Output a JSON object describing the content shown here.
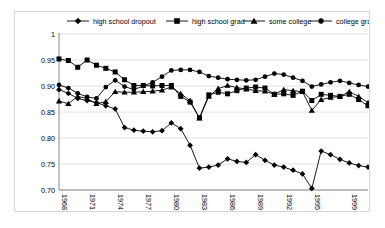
{
  "chart_data": {
    "type": "line",
    "title": "",
    "subtitle": "",
    "xlabel": "",
    "ylabel": "",
    "grid": true,
    "legend_position": "top",
    "ylim": [
      0.7,
      1.0
    ],
    "yticks": [
      "1",
      "0.95",
      "0.90",
      "0.85",
      "0.80",
      "0.75",
      "0.70"
    ],
    "ytick_values": [
      1.0,
      0.95,
      0.9,
      0.85,
      0.8,
      0.75,
      0.7
    ],
    "x": [
      1968,
      1969,
      1970,
      1971,
      1972,
      1973,
      1974,
      1975,
      1976,
      1977,
      1978,
      1979,
      1980,
      1981,
      1982,
      1983,
      1984,
      1985,
      1986,
      1987,
      1988,
      1989,
      1990,
      1991,
      1992,
      1993,
      1994,
      1995,
      1996,
      1997,
      1998,
      1999,
      2000,
      2001
    ],
    "xtick_labels": [
      "1968",
      "1971",
      "1974",
      "1977",
      "1980",
      "1983",
      "1986",
      "1989",
      "1992",
      "1995",
      "1999"
    ],
    "xtick_values": [
      1968,
      1971,
      1974,
      1977,
      1980,
      1983,
      1986,
      1989,
      1992,
      1995,
      1999
    ],
    "series": [
      {
        "name": "high school dropout",
        "marker": "diamond",
        "values": [
          0.893,
          0.886,
          0.876,
          0.872,
          0.868,
          0.862,
          0.856,
          0.82,
          0.815,
          0.813,
          0.812,
          0.814,
          0.829,
          0.818,
          0.786,
          0.742,
          0.744,
          0.748,
          0.76,
          0.755,
          0.753,
          0.768,
          0.757,
          0.748,
          0.744,
          0.738,
          0.731,
          0.703,
          0.775,
          0.768,
          0.759,
          0.752,
          0.747,
          0.744
        ]
      },
      {
        "name": "high school grad",
        "marker": "square",
        "values": [
          0.952,
          0.949,
          0.936,
          0.95,
          0.94,
          0.934,
          0.927,
          0.912,
          0.901,
          0.901,
          0.9,
          0.901,
          0.901,
          0.88,
          0.869,
          0.839,
          0.883,
          0.888,
          0.885,
          0.891,
          0.896,
          0.898,
          0.896,
          0.884,
          0.885,
          0.882,
          0.89,
          0.872,
          0.884,
          0.882,
          0.88,
          0.884,
          0.874,
          0.862
        ]
      },
      {
        "name": "some college",
        "marker": "triangle",
        "values": [
          0.871,
          0.866,
          0.88,
          0.876,
          0.866,
          0.87,
          0.889,
          0.888,
          0.888,
          0.889,
          0.89,
          0.892,
          0.898,
          0.885,
          0.872,
          0.838,
          0.88,
          0.895,
          0.901,
          0.897,
          0.894,
          0.891,
          0.89,
          0.884,
          0.893,
          0.891,
          0.889,
          0.853,
          0.874,
          0.878,
          0.88,
          0.889,
          0.88,
          0.868
        ]
      },
      {
        "name": "college grad",
        "marker": "circle",
        "values": [
          0.902,
          0.896,
          0.886,
          0.879,
          0.876,
          0.898,
          0.911,
          0.899,
          0.893,
          0.9,
          0.907,
          0.918,
          0.93,
          0.931,
          0.931,
          0.927,
          0.919,
          0.916,
          0.913,
          0.912,
          0.911,
          0.912,
          0.918,
          0.924,
          0.922,
          0.916,
          0.91,
          0.899,
          0.903,
          0.907,
          0.91,
          0.906,
          0.902,
          0.899
        ]
      }
    ]
  },
  "legend": {
    "items": [
      {
        "label": "high school dropout",
        "marker": "diamond"
      },
      {
        "label": "high school grad",
        "marker": "square"
      },
      {
        "label": "some college",
        "marker": "triangle"
      },
      {
        "label": "college grad",
        "marker": "circle"
      }
    ]
  },
  "colors": {
    "series": "#000000",
    "grid": "#e2e2e2",
    "axis": "#8a8a8a",
    "frame": "#d4d4d4",
    "background": "#ffffff"
  }
}
